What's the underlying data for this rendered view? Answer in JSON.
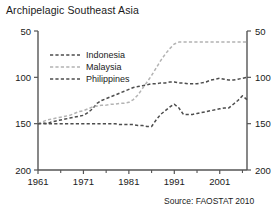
{
  "chart_data": {
    "type": "line",
    "title": "Archipelagic Southeast Asia",
    "xlabel": "",
    "ylabel": "",
    "xlim": [
      1961,
      2007
    ],
    "ylim": [
      50,
      200
    ],
    "yticks": [
      50,
      100,
      150,
      200
    ],
    "xticks": [
      1961,
      1971,
      1981,
      1991,
      2001
    ],
    "xminor_ticks": [
      1966,
      1976,
      1986,
      1996,
      2006
    ],
    "grid": false,
    "dual_y_axis": true,
    "legend_position": "upper-left-inside",
    "source": "Source: FAOSTAT 2010",
    "x": [
      1961,
      1962,
      1963,
      1964,
      1965,
      1966,
      1967,
      1968,
      1969,
      1970,
      1971,
      1972,
      1973,
      1974,
      1975,
      1976,
      1977,
      1978,
      1979,
      1980,
      1981,
      1982,
      1983,
      1984,
      1985,
      1986,
      1987,
      1988,
      1989,
      1990,
      1991,
      1992,
      1993,
      1994,
      1995,
      1996,
      1997,
      1998,
      1999,
      2000,
      2001,
      2002,
      2003,
      2004,
      2005,
      2006,
      2007
    ],
    "series": [
      {
        "name": "Indonesia",
        "color": "#4d4d4d",
        "style": "dashed",
        "values": [
          100,
          101,
          100,
          102,
          103,
          104,
          105,
          106,
          107,
          108,
          109,
          112,
          116,
          122,
          125,
          127,
          129,
          131,
          133,
          135,
          137,
          139,
          140,
          141,
          142,
          143,
          143,
          144,
          144,
          145,
          145,
          144,
          144,
          143,
          143,
          143,
          144,
          145,
          147,
          148,
          149,
          148,
          147,
          147,
          148,
          149,
          150
        ]
      },
      {
        "name": "Malaysia",
        "color": "#b3b3b3",
        "style": "dashed",
        "values": [
          100,
          102,
          104,
          105,
          106,
          107,
          108,
          109,
          111,
          113,
          114,
          116,
          118,
          119,
          120,
          120,
          121,
          121,
          122,
          122,
          123,
          126,
          131,
          138,
          145,
          152,
          160,
          168,
          175,
          181,
          186,
          188,
          188,
          188,
          188,
          188,
          188,
          188,
          188,
          188,
          188,
          188,
          188,
          188,
          188,
          188,
          188
        ]
      },
      {
        "name": "Philippines",
        "color": "#4d4d4d",
        "style": "dashed",
        "values": [
          100,
          100,
          100,
          100,
          100,
          100,
          100,
          100,
          100,
          100,
          100,
          100,
          100,
          100,
          100,
          100,
          100,
          100,
          99,
          99,
          99,
          99,
          98,
          98,
          97,
          97,
          104,
          110,
          114,
          118,
          121,
          117,
          110,
          110,
          110,
          111,
          112,
          113,
          114,
          115,
          116,
          117,
          117,
          121,
          125,
          130,
          126
        ]
      }
    ]
  },
  "axes": {
    "left_tick_labels": [
      "200",
      "150",
      "100",
      "50"
    ],
    "right_tick_labels": [
      "200",
      "150",
      "100",
      "50"
    ],
    "x_tick_labels": [
      "1961",
      "1971",
      "1981",
      "1991",
      "2001"
    ]
  },
  "legend": {
    "items": [
      {
        "label": "Indonesia"
      },
      {
        "label": "Malaysia"
      },
      {
        "label": "Philippines"
      }
    ]
  },
  "footer": {
    "source": "Source: FAOSTAT 2010"
  }
}
